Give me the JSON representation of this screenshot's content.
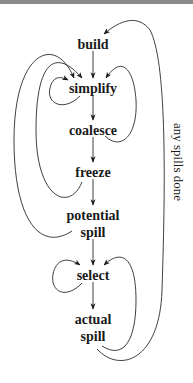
{
  "diagram": {
    "type": "flowchart",
    "nodes": [
      {
        "id": "build",
        "label": "build"
      },
      {
        "id": "simplify",
        "label": "simplify"
      },
      {
        "id": "coalesce",
        "label": "coalesce"
      },
      {
        "id": "freeze",
        "label": "freeze"
      },
      {
        "id": "potential_spill",
        "line1": "potential",
        "line2": "spill"
      },
      {
        "id": "select",
        "label": "select"
      },
      {
        "id": "actual_spill",
        "line1": "actual",
        "line2": "spill"
      }
    ],
    "edges": [
      {
        "from": "build",
        "to": "simplify"
      },
      {
        "from": "simplify",
        "to": "coalesce"
      },
      {
        "from": "coalesce",
        "to": "freeze"
      },
      {
        "from": "freeze",
        "to": "potential_spill"
      },
      {
        "from": "potential_spill",
        "to": "select"
      },
      {
        "from": "select",
        "to": "actual_spill"
      },
      {
        "from": "simplify",
        "to": "simplify"
      },
      {
        "from": "coalesce",
        "to": "simplify"
      },
      {
        "from": "freeze",
        "to": "simplify"
      },
      {
        "from": "potential_spill",
        "to": "simplify"
      },
      {
        "from": "select",
        "to": "select"
      },
      {
        "from": "actual_spill",
        "to": "select"
      },
      {
        "from": "actual_spill",
        "to": "build",
        "label": "any spills done"
      }
    ],
    "edge_label": "any spills done"
  }
}
